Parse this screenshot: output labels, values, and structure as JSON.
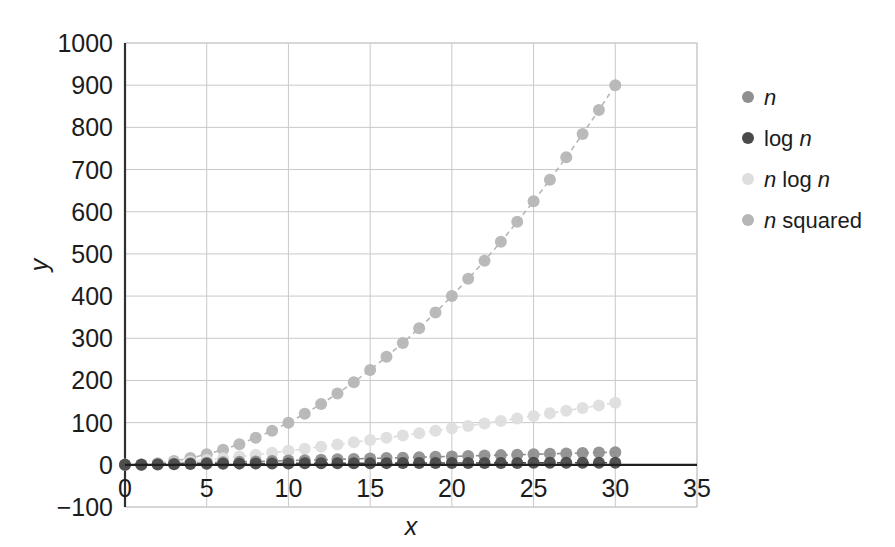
{
  "chart_data": {
    "type": "line",
    "title": "",
    "subtitle": "",
    "xlabel": "x",
    "ylabel": "y",
    "xlim": [
      0,
      35
    ],
    "ylim": [
      -100,
      1000
    ],
    "xticks": [
      0,
      5,
      10,
      15,
      20,
      25,
      30,
      35
    ],
    "yticks": [
      -100,
      0,
      100,
      200,
      300,
      400,
      500,
      600,
      700,
      800,
      900,
      1000
    ],
    "xtick_labels": [
      "0",
      "5",
      "10",
      "15",
      "20",
      "25",
      "30",
      "35"
    ],
    "ytick_labels": [
      "-100",
      "0",
      "100",
      "200",
      "300",
      "400",
      "500",
      "600",
      "700",
      "800",
      "900",
      "1000"
    ],
    "grid": true,
    "grid_color": "#c9c9c9",
    "legend_position": "right",
    "marker": "circle",
    "linestyle": "dashed",
    "x": [
      0,
      1,
      2,
      3,
      4,
      5,
      6,
      7,
      8,
      9,
      10,
      11,
      12,
      13,
      14,
      15,
      16,
      17,
      18,
      19,
      20,
      21,
      22,
      23,
      24,
      25,
      26,
      27,
      28,
      29,
      30
    ],
    "series": [
      {
        "name": "n",
        "label_parts": [
          {
            "text": "n",
            "italic": true
          }
        ],
        "color": "#8f8f8f",
        "values": [
          0,
          1,
          2,
          3,
          4,
          5,
          6,
          7,
          8,
          9,
          10,
          11,
          12,
          13,
          14,
          15,
          16,
          17,
          18,
          19,
          20,
          21,
          22,
          23,
          24,
          25,
          26,
          27,
          28,
          29,
          30
        ]
      },
      {
        "name": "log n",
        "label_parts": [
          {
            "text": "log ",
            "italic": false
          },
          {
            "text": "n",
            "italic": true
          }
        ],
        "color": "#4a4a4a",
        "values": [
          0,
          0,
          1,
          1.58,
          2,
          2.32,
          2.58,
          2.81,
          3,
          3.17,
          3.32,
          3.46,
          3.58,
          3.7,
          3.81,
          3.91,
          4,
          4.09,
          4.17,
          4.25,
          4.32,
          4.39,
          4.46,
          4.52,
          4.58,
          4.64,
          4.7,
          4.75,
          4.81,
          4.86,
          4.91
        ]
      },
      {
        "name": "n log n",
        "label_parts": [
          {
            "text": "n",
            "italic": true
          },
          {
            "text": " log ",
            "italic": false
          },
          {
            "text": "n",
            "italic": true
          }
        ],
        "color": "#dedede",
        "values": [
          0,
          0,
          2,
          4.75,
          8,
          11.6,
          15.5,
          19.65,
          24,
          28.53,
          33.22,
          38.05,
          43,
          48.07,
          53.3,
          58.6,
          64,
          69.5,
          75.06,
          80.7,
          86.44,
          92.2,
          98.1,
          104,
          110,
          116,
          122.2,
          128.4,
          134.6,
          140.9,
          147.2
        ]
      },
      {
        "name": "n squared",
        "label_parts": [
          {
            "text": "n",
            "italic": true
          },
          {
            "text": " squared",
            "italic": false
          }
        ],
        "color": "#b6b6b6",
        "values": [
          0,
          1,
          4,
          9,
          16,
          25,
          36,
          49,
          64,
          81,
          100,
          121,
          144,
          169,
          196,
          225,
          256,
          289,
          324,
          361,
          400,
          441,
          484,
          529,
          576,
          625,
          676,
          729,
          784,
          841,
          900
        ]
      }
    ]
  }
}
